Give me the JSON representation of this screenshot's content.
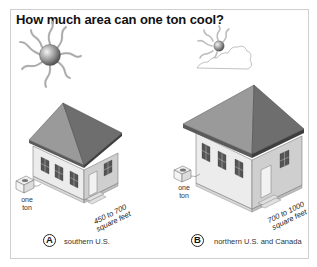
{
  "title": "How much area can one ton cool?",
  "panels": [
    {
      "badge": "A",
      "region": "southern U.S.",
      "unit_label_line1": "one",
      "unit_label_line2": "ton",
      "area_line1": "450 to 700",
      "area_line2": "square feet",
      "sun": "full-sun-icon"
    },
    {
      "badge": "B",
      "region": "northern U.S. and Canada",
      "unit_label_line1": "one",
      "unit_label_line2": "ton",
      "area_line1": "700 to 1000",
      "area_line2": "square feet",
      "sun": "sun-behind-cloud-icon"
    }
  ],
  "colors": {
    "roof_light": "#8f8f8f",
    "roof_dark": "#6b6b6b",
    "wall_front": "#e6e6e6",
    "wall_side": "#c9c9c9",
    "frame_border": "#cfcfcf"
  }
}
